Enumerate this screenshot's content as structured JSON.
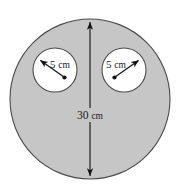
{
  "figure": {
    "name": "annulus-with-two-circular-holes",
    "colors": {
      "shaded_fill": "#c6c6c6",
      "hole_fill": "#ffffff",
      "outline": "#4a4a4a",
      "annotation": "#1a1a1a",
      "background": "#ffffff"
    },
    "big_circle": {
      "label": "30 cm",
      "value": 30,
      "unit": "cm",
      "measure": "diameter",
      "center_x": 90,
      "center_y": 99,
      "radius": 80
    },
    "holes": [
      {
        "id": "left-hole",
        "label": "5 cm",
        "value": 5,
        "unit": "cm",
        "measure": "radius",
        "center_x": 55,
        "center_y": 70,
        "radius": 22,
        "arrow_direction": "up-left"
      },
      {
        "id": "right-hole",
        "label": "5 cm",
        "value": 5,
        "unit": "cm",
        "measure": "radius",
        "center_x": 124,
        "center_y": 70,
        "radius": 22,
        "arrow_direction": "up-right"
      }
    ],
    "labels": {
      "diameter_number": "30",
      "diameter_unit": "cm",
      "left_radius_number": "5",
      "left_radius_unit": "cm",
      "right_radius_number": "5",
      "right_radius_unit": "cm"
    }
  }
}
